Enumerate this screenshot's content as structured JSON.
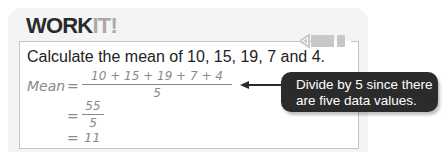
{
  "header": {
    "title_part1": "WORK",
    "title_part2": "IT!"
  },
  "problem": {
    "prompt": "Calculate the mean of 10, 15, 19, 7 and 4."
  },
  "working": {
    "label": "Mean",
    "equals": "=",
    "step1": {
      "numerator": "10 + 15 + 19 + 7 + 4",
      "denominator": "5"
    },
    "step2": {
      "numerator": "55",
      "denominator": "5"
    },
    "step3": {
      "value": "11"
    }
  },
  "callout": {
    "line1": "Divide by 5 since there",
    "line2": "are five data values."
  },
  "colors": {
    "panel_bg": "#f5f5f5",
    "frame_border": "#c4c4c4",
    "title_dark": "#2a2a2a",
    "title_accent": "#a9a9a9",
    "handwriting": "#8a8a8a",
    "callout_bg": "#2b2b2b",
    "callout_text": "#ffffff",
    "pencil": "#c8c8c8"
  }
}
